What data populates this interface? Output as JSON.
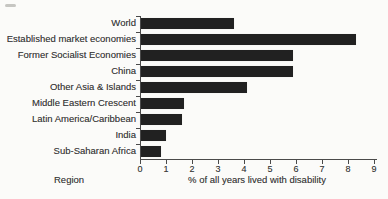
{
  "figure": {
    "background": "#fbfbf9",
    "text_color": "#3c3c3c"
  },
  "chart_data": {
    "type": "bar",
    "orientation": "horizontal",
    "categories": [
      "World",
      "Established market economies",
      "Former Socialist Economies",
      "China",
      "Other Asia & Islands",
      "Middle Eastern Crescent",
      "Latin America/Caribbean",
      "India",
      "Sub-Saharan Africa"
    ],
    "values": [
      3.6,
      8.3,
      5.9,
      5.9,
      4.1,
      1.7,
      1.6,
      1.0,
      0.8
    ],
    "xlabel": "% of all years lived with disability",
    "ylabel": "Region",
    "xlim": [
      0,
      9
    ],
    "x_ticks": [
      0,
      1,
      2,
      3,
      4,
      5,
      6,
      7,
      8,
      9
    ],
    "bar_color": "#212121",
    "axis_color": "#4a4a4a",
    "grid": false,
    "legend": "none"
  }
}
